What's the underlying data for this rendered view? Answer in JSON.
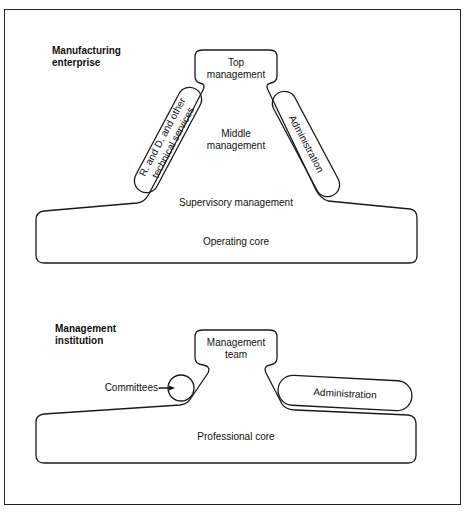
{
  "diagram": {
    "top": {
      "title_line1": "Manufacturing",
      "title_line2": "enterprise",
      "apex": {
        "line1": "Top",
        "line2": "management"
      },
      "left_staff": {
        "line1": "R. and D. and other",
        "line2": "technical services"
      },
      "middle": {
        "line1": "Middle",
        "line2": "management"
      },
      "right_staff": "Administration",
      "supervisory": "Supervisory management",
      "core": "Operating core"
    },
    "bottom": {
      "title_line1": "Management",
      "title_line2": "institution",
      "apex": {
        "line1": "Management",
        "line2": "team"
      },
      "committees": "Committees",
      "right_staff": "Administration",
      "core": "Professional core"
    },
    "colors": {
      "stroke": "#1a1a1a",
      "background": "#ffffff"
    }
  }
}
